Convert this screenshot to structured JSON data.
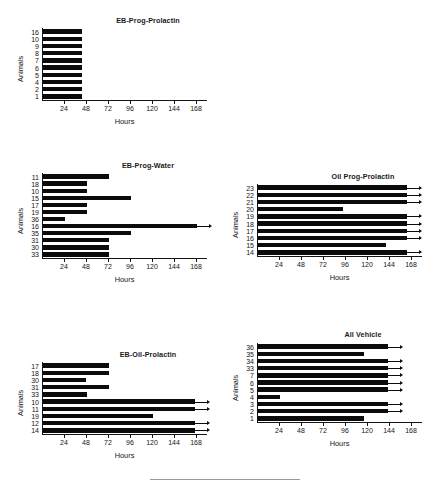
{
  "figure": {
    "background": "#ffffff",
    "bar_color": "#0b0b0b",
    "axis_color": "#141414",
    "axis_xlabel": "Hours",
    "axis_ylabel": "Animals"
  },
  "chart_data": [
    {
      "type": "bar",
      "orientation": "horizontal",
      "title": "EB-Prog-Prolactin",
      "xlabel": "Hours",
      "ylabel": "Animals",
      "xlim": [
        0,
        180
      ],
      "xticks": [
        24,
        48,
        72,
        96,
        120,
        144,
        168
      ],
      "xtick_labels": [
        "24",
        "48",
        "72",
        "96",
        "120",
        "144",
        "168"
      ],
      "grid": false,
      "categories": [
        "16",
        "10",
        "9",
        "8",
        "7",
        "6",
        "5",
        "4",
        "2",
        "1"
      ],
      "values": [
        42,
        42,
        42,
        42,
        42,
        42,
        42,
        42,
        42,
        42
      ],
      "censored": [
        false,
        false,
        false,
        false,
        false,
        false,
        false,
        false,
        false,
        false
      ]
    },
    {
      "type": "bar",
      "orientation": "horizontal",
      "title": "EB-Prog-Water",
      "xlabel": "Hours",
      "ylabel": "Animals",
      "xlim": [
        0,
        180
      ],
      "xticks": [
        24,
        48,
        72,
        96,
        120,
        144,
        168
      ],
      "xtick_labels": [
        "24",
        "48",
        "72",
        "96",
        "120",
        "144",
        "168"
      ],
      "grid": false,
      "categories": [
        "11",
        "18",
        "10",
        "15",
        "17",
        "19",
        "36",
        "16",
        "35",
        "31",
        "30",
        "33"
      ],
      "values": [
        72,
        48,
        48,
        96,
        48,
        48,
        24,
        168,
        96,
        72,
        72,
        72
      ],
      "censored": [
        false,
        false,
        false,
        false,
        false,
        false,
        false,
        true,
        false,
        false,
        false,
        false
      ]
    },
    {
      "type": "bar",
      "orientation": "horizontal",
      "title": "Oil Prog-Prolactin",
      "xlabel": "Hours",
      "ylabel": "Animals",
      "xlim": [
        0,
        180
      ],
      "xticks": [
        24,
        48,
        72,
        96,
        120,
        144,
        168
      ],
      "xtick_labels": [
        "24",
        "48",
        "72",
        "96",
        "120",
        "144",
        "168"
      ],
      "grid": false,
      "categories": [
        "23",
        "22",
        "21",
        "20",
        "19",
        "18",
        "17",
        "16",
        "15",
        "14"
      ],
      "values": [
        162,
        162,
        162,
        93,
        162,
        162,
        162,
        162,
        140,
        162
      ],
      "censored": [
        true,
        true,
        true,
        false,
        true,
        true,
        true,
        true,
        false,
        true
      ]
    },
    {
      "type": "bar",
      "orientation": "horizontal",
      "title": "EB-Oil-Prolactin",
      "xlabel": "Hours",
      "ylabel": "Animals",
      "xlim": [
        0,
        180
      ],
      "xticks": [
        24,
        48,
        72,
        96,
        120,
        144,
        168
      ],
      "xtick_labels": [
        "24",
        "48",
        "72",
        "96",
        "120",
        "144",
        "168"
      ],
      "grid": false,
      "categories": [
        "17",
        "18",
        "30",
        "31",
        "33",
        "10",
        "11",
        "19",
        "12",
        "14"
      ],
      "values": [
        72,
        72,
        47,
        72,
        48,
        166,
        166,
        120,
        166,
        166
      ],
      "censored": [
        false,
        false,
        false,
        false,
        false,
        true,
        true,
        false,
        true,
        true
      ]
    },
    {
      "type": "bar",
      "orientation": "horizontal",
      "title": "All Vehicle",
      "xlabel": "Hours",
      "ylabel": "Animals",
      "xlim": [
        0,
        180
      ],
      "xticks": [
        24,
        48,
        72,
        96,
        120,
        144,
        168
      ],
      "xtick_labels": [
        "24",
        "48",
        "72",
        "96",
        "120",
        "144",
        "168"
      ],
      "grid": false,
      "categories": [
        "36",
        "35",
        "34",
        "33",
        "7",
        "6",
        "5",
        "4",
        "3",
        "2",
        "1"
      ],
      "values": [
        142,
        116,
        142,
        142,
        142,
        142,
        142,
        24,
        142,
        142,
        116
      ],
      "censored": [
        true,
        false,
        true,
        true,
        true,
        true,
        true,
        false,
        true,
        true,
        false
      ]
    }
  ]
}
